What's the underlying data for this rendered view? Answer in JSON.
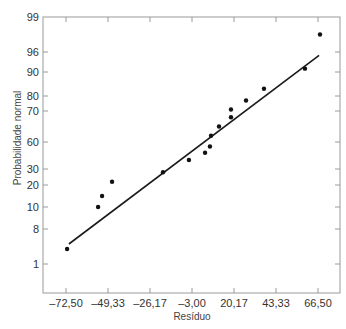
{
  "chart_data": {
    "type": "scatter",
    "title": "",
    "xlabel": "Resíduo",
    "ylabel": "Probabilidade normal",
    "xlim": [
      -72.5,
      66.5
    ],
    "x_ticks": [
      "-72,50",
      "-49,33",
      "-26,17",
      "-3,00",
      "20,17",
      "43,33",
      "66,50"
    ],
    "x_tick_values": [
      -72.5,
      -49.33,
      -26.17,
      -3.0,
      20.17,
      43.33,
      66.5
    ],
    "y_scale": "normal-probability",
    "y_ticks": [
      "99",
      "96",
      "90",
      "80",
      "70",
      "60",
      "30",
      "20",
      "10",
      "8",
      "1"
    ],
    "y_tick_values": [
      99,
      96,
      90,
      80,
      70,
      60,
      30,
      20,
      10,
      8,
      1
    ],
    "grid": false,
    "legend": null,
    "series": [
      {
        "name": "Resíduos",
        "marker": "dot",
        "points": [
          {
            "x": -71.9,
            "y": 4
          },
          {
            "x": -54.8,
            "y": 10
          },
          {
            "x": -52.6,
            "y": 15
          },
          {
            "x": -47.1,
            "y": 22
          },
          {
            "x": -19.0,
            "y": 28
          },
          {
            "x": -4.7,
            "y": 40
          },
          {
            "x": 4.2,
            "y": 48
          },
          {
            "x": 6.9,
            "y": 55
          },
          {
            "x": 7.5,
            "y": 62
          },
          {
            "x": 11.9,
            "y": 65
          },
          {
            "x": 18.5,
            "y": 68
          },
          {
            "x": 18.5,
            "y": 71
          },
          {
            "x": 26.8,
            "y": 77
          },
          {
            "x": 36.7,
            "y": 83
          },
          {
            "x": 59.3,
            "y": 91
          },
          {
            "x": 67.6,
            "y": 97.5
          }
        ]
      },
      {
        "name": "Reta de referência",
        "type": "line",
        "points": [
          {
            "x": -70.9,
            "y": 5
          },
          {
            "x": 67.1,
            "y": 95
          }
        ]
      }
    ]
  },
  "labels": {
    "xlabel": "Resíduo",
    "ylabel": "Probabilidade normal"
  }
}
